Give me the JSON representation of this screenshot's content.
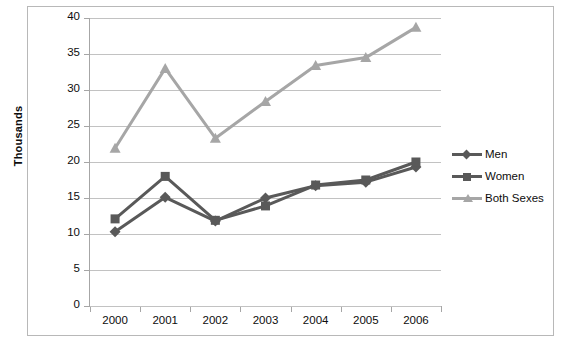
{
  "chart_data": {
    "type": "line",
    "title": "",
    "xlabel": "",
    "ylabel": "Thousands",
    "categories": [
      "2000",
      "2001",
      "2002",
      "2003",
      "2004",
      "2005",
      "2006"
    ],
    "ylim": [
      0,
      40
    ],
    "yticks": [
      0,
      5,
      10,
      15,
      20,
      25,
      30,
      35,
      40
    ],
    "grid": true,
    "legend_position": "right",
    "series": [
      {
        "name": "Men",
        "color": "#595959",
        "marker": "diamond",
        "values": [
          10.3,
          15.1,
          11.8,
          15.0,
          16.7,
          17.2,
          19.3
        ]
      },
      {
        "name": "Women",
        "color": "#595959",
        "marker": "square",
        "values": [
          12.1,
          18.0,
          11.9,
          13.9,
          16.8,
          17.5,
          20.0
        ]
      },
      {
        "name": "Both Sexes",
        "color": "#a6a6a6",
        "marker": "triangle",
        "values": [
          21.9,
          33.0,
          23.3,
          28.4,
          33.4,
          34.5,
          38.7
        ]
      }
    ]
  },
  "axis": {
    "y_title": "Thousands",
    "y_labels": [
      "40",
      "35",
      "30",
      "25",
      "20",
      "15",
      "10",
      "5",
      "0"
    ],
    "x_labels": [
      "2000",
      "2001",
      "2002",
      "2003",
      "2004",
      "2005",
      "2006"
    ]
  },
  "legend": {
    "items": [
      {
        "label": "Men"
      },
      {
        "label": "Women"
      },
      {
        "label": "Both Sexes"
      }
    ]
  },
  "colors": {
    "dark_series": "#595959",
    "light_series": "#a6a6a6",
    "gridline": "#c2c2c2",
    "axis": "#a6a6a6",
    "border": "#b8b8b8"
  }
}
